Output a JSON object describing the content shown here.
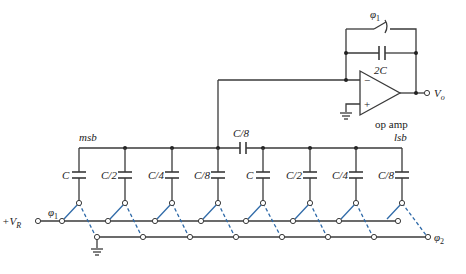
{
  "figure": {
    "type": "charge-redistribution DAC circuit with split capacitor array",
    "colors": {
      "wire": "#3a3a3a",
      "switch_arrow": "#2f6aa8",
      "background": "#ffffff"
    }
  },
  "labels": {
    "feedback_switch": "φ1",
    "feedback_switch_sub": "1",
    "feedback_cap": "2C",
    "opamp": "op amp",
    "minus": "−",
    "plus": "+",
    "output": "V",
    "output_sub": "o",
    "msb": "msb",
    "lsb": "lsb",
    "bridge_cap": "C/8",
    "input": "+V",
    "input_sub": "R",
    "phi1": "φ",
    "phi1_sub": "1",
    "phi2": "φ",
    "phi2_sub": "2"
  },
  "msb_array": [
    {
      "label": "C"
    },
    {
      "label": "C/2"
    },
    {
      "label": "C/4"
    },
    {
      "label": "C/8"
    }
  ],
  "lsb_array": [
    {
      "label": "C"
    },
    {
      "label": "C/2"
    },
    {
      "label": "C/4"
    },
    {
      "label": "C/8"
    }
  ]
}
